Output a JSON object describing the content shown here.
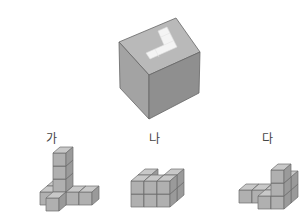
{
  "figure": {
    "main_object": {
      "name": "large-cube",
      "description": "Large cube with an L-shaped white inset on top face",
      "colors": {
        "top": "#b9b9b9",
        "left": "#a3a3a3",
        "right": "#8f8f8f",
        "inset": "#f4f4f4",
        "edge": "#666666"
      }
    },
    "options": [
      {
        "label": "가",
        "cubes": [
          [
            0,
            0,
            0
          ],
          [
            0,
            0,
            1
          ],
          [
            0,
            0,
            2
          ],
          [
            0,
            0,
            3
          ],
          [
            -1,
            0,
            0
          ],
          [
            0,
            -1,
            0
          ],
          [
            1,
            0,
            0
          ],
          [
            2,
            0,
            0
          ],
          [
            -1,
            1,
            0
          ]
        ]
      },
      {
        "label": "나",
        "cubes": [
          [
            0,
            0,
            0
          ],
          [
            1,
            0,
            0
          ],
          [
            2,
            0,
            0
          ],
          [
            0,
            0,
            1
          ],
          [
            1,
            -1,
            1
          ],
          [
            2,
            -1,
            1
          ],
          [
            2,
            0,
            1
          ],
          [
            2,
            -1,
            0
          ],
          [
            1,
            -1,
            0
          ],
          [
            0,
            -1,
            0
          ],
          [
            0,
            -1,
            1
          ]
        ]
      },
      {
        "label": "다",
        "cubes": [
          [
            0,
            0,
            0
          ],
          [
            1,
            0,
            0
          ],
          [
            2,
            0,
            0
          ],
          [
            3,
            0,
            0
          ],
          [
            3,
            -1,
            0
          ],
          [
            3,
            0,
            1
          ],
          [
            3,
            -1,
            1
          ],
          [
            3,
            -1,
            2
          ],
          [
            2,
            -1,
            0
          ]
        ]
      }
    ],
    "cube_colors": {
      "top": "#c8c8c8",
      "left": "#b0b0b0",
      "right": "#9a9a9a",
      "edge": "#6e6e6e"
    }
  }
}
